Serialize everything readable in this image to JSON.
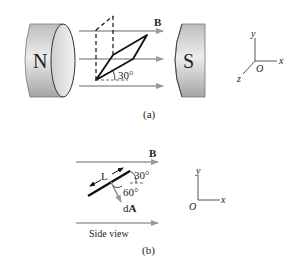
{
  "figure_a": {
    "caption": "(a)",
    "north_pole_label": "N",
    "south_pole_label": "S",
    "field_label": "B",
    "angle_label": "30°",
    "axes": {
      "x": "x",
      "y": "y",
      "z": "z",
      "origin": "O"
    }
  },
  "figure_b": {
    "caption": "(b)",
    "field_label": "B",
    "length_label": "L",
    "angle_top_label": "30°",
    "angle_normal_label": "60°",
    "area_vector_label_prefix": "d",
    "area_vector_label_bold": "A",
    "view_label": "Side view",
    "axes": {
      "x": "x",
      "y": "y",
      "origin": "O"
    }
  },
  "colors": {
    "magnet_light": "#e6e6e6",
    "magnet_dark": "#a9a9a9",
    "field_arrow": "#9a9a9a",
    "line": "#111111"
  }
}
